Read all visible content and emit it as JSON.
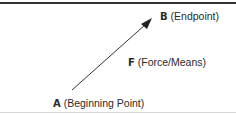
{
  "diagram": {
    "points": {
      "begin": {
        "letter": "A",
        "text": "(Beginning Point)"
      },
      "end": {
        "letter": "B",
        "text": "(Endpoint)"
      },
      "force": {
        "letter": "F",
        "text": "(Force/Means)"
      }
    },
    "arrow": {
      "from": "A",
      "to": "B"
    },
    "colors": {
      "line": "#333333",
      "rule": "#333333"
    }
  }
}
